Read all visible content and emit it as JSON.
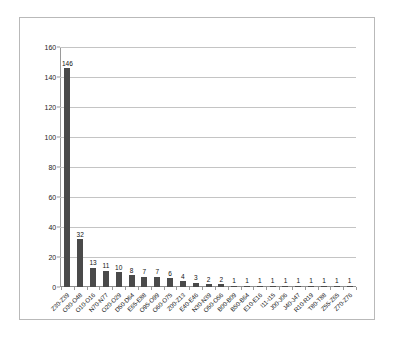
{
  "figure": {
    "frame_border_color": "#b9b9b9",
    "background_color": "#ffffff"
  },
  "chart_data": {
    "type": "bar",
    "title": "",
    "subtitle": "",
    "xlabel": "",
    "ylabel": "",
    "ylim": [
      0,
      160
    ],
    "ytick_step": 20,
    "ytick_labels": [
      "0",
      "20",
      "40",
      "60",
      "80",
      "100",
      "120",
      "140",
      "160"
    ],
    "grid": "horizontal",
    "legend": "none",
    "bar_color": "#4a4a4a",
    "data_labels": true,
    "categories": [
      "Z30-Z39",
      "O30-O48",
      "O10-O16",
      "N70-N77",
      "O20-O29",
      "D50-D64",
      "E65-E88",
      "O95-O99",
      "O60-O75",
      "Z00-Z13",
      "E40-E46",
      "N30-N39",
      "O50-O56",
      "B00-B09",
      "B50-B64",
      "E10-E16",
      "I11-I15",
      "J00-J06",
      "J40-J47",
      "R10-R19",
      "T80-T88",
      "Z55-Z65",
      "Z70-Z76"
    ],
    "values": [
      146,
      32,
      13,
      11,
      10,
      8,
      7,
      7,
      6,
      4,
      3,
      2,
      2,
      1,
      1,
      1,
      1,
      1,
      1,
      1,
      1,
      1,
      1
    ]
  }
}
